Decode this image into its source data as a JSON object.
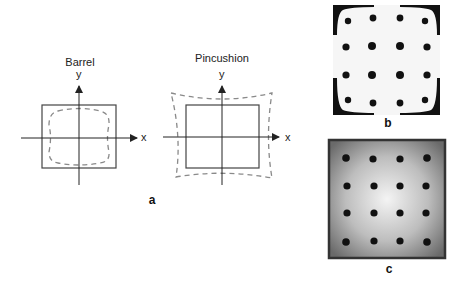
{
  "figure": {
    "panel_a": {
      "label": "a",
      "barrel": {
        "title": "Barrel",
        "x_axis_label": "x",
        "y_axis_label": "y",
        "description": "Solid square with inward-bulging dashed barrel-distorted outline"
      },
      "pincushion": {
        "title": "Pincushion",
        "x_axis_label": "x",
        "y_axis_label": "y",
        "description": "Solid square with outward-cornered dashed pincushion-distorted outline"
      }
    },
    "panel_b": {
      "label": "b",
      "description": "4x4 grid of dots on light field with dark pincushion-shaped corners",
      "grid_rows": 4,
      "grid_cols": 4
    },
    "panel_c": {
      "label": "c",
      "description": "4x4 grid of dots on radially shaded gray field with dark border",
      "grid_rows": 4,
      "grid_cols": 4
    }
  },
  "colors": {
    "solid_line": "#444444",
    "dashed_line": "#8a8a8a",
    "dot": "#111111"
  }
}
